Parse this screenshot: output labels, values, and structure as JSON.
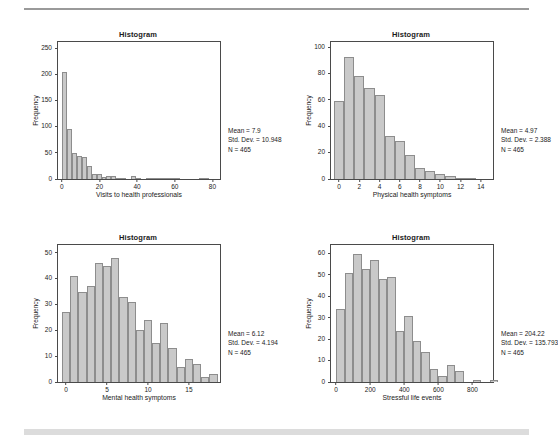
{
  "figure": {
    "panel_count": 4,
    "common_title": "Histogram",
    "common_ylabel": "Frequency",
    "common_n_label": "N = 465"
  },
  "chart_data": [
    {
      "type": "bar",
      "title": "Histogram",
      "xlabel": "Visits to health professionals",
      "ylabel": "Frequency",
      "xlim": [
        -2,
        84
      ],
      "ylim": [
        0,
        262
      ],
      "xticks": [
        0,
        20,
        40,
        60,
        80
      ],
      "yticks": [
        0,
        50,
        100,
        150,
        200,
        250
      ],
      "grid": false,
      "legend": "none",
      "bin_width": 2.6,
      "bin_starts": [
        0.3,
        2.9,
        5.5,
        8.1,
        10.7,
        13.3,
        15.9,
        18.5,
        21.1,
        23.7,
        26.3,
        28.9,
        31.5,
        34.1,
        36.7,
        39.3,
        41.9,
        44.5,
        47.1,
        49.7,
        52.3,
        54.9,
        57.5,
        60.1,
        62.7,
        65.3,
        67.9,
        70.5,
        73.1,
        75.7,
        78.3
      ],
      "values": [
        205,
        95,
        49,
        44,
        43,
        24,
        10,
        10,
        3,
        5,
        5,
        1,
        1,
        0,
        5,
        1,
        0,
        1,
        1,
        1,
        1,
        1,
        2,
        2,
        0,
        0,
        0,
        0,
        1,
        1,
        0
      ],
      "annotations": {
        "mean": "Mean = 7.9",
        "std_dev": "Std. Dev. = 10.948",
        "n": "N = 465"
      }
    },
    {
      "type": "bar",
      "title": "Histogram",
      "xlabel": "Physical health symptoms",
      "ylabel": "Frequency",
      "xlim": [
        -0.8,
        15.2
      ],
      "ylim": [
        0,
        104
      ],
      "xticks": [
        0,
        2,
        4,
        6,
        8,
        10,
        12,
        14
      ],
      "yticks": [
        0,
        20,
        40,
        60,
        80,
        100
      ],
      "grid": false,
      "legend": "none",
      "bin_width": 1,
      "bin_starts": [
        -0.5,
        0.5,
        1.5,
        2.5,
        3.5,
        4.5,
        5.5,
        6.5,
        7.5,
        8.5,
        9.5,
        10.5,
        11.5,
        12.5,
        13.5,
        14.5
      ],
      "values": [
        59,
        93,
        78,
        69,
        64,
        33,
        29,
        18,
        8,
        6,
        4,
        2,
        1,
        1,
        0,
        0
      ],
      "annotations": {
        "mean": "Mean = 4.97",
        "std_dev": "Std. Dev. = 2.388",
        "n": "N = 465"
      }
    },
    {
      "type": "bar",
      "title": "Histogram",
      "xlabel": "Mental health symptoms",
      "ylabel": "Frequency",
      "xlim": [
        -1.0,
        18.8
      ],
      "ylim": [
        0,
        53
      ],
      "xticks": [
        0,
        5,
        10,
        15
      ],
      "yticks": [
        0,
        10,
        20,
        30,
        40,
        50
      ],
      "grid": false,
      "legend": "none",
      "bin_width": 1,
      "bin_starts": [
        -0.5,
        0.5,
        1.5,
        2.5,
        3.5,
        4.5,
        5.5,
        6.5,
        7.5,
        8.5,
        9.5,
        10.5,
        11.5,
        12.5,
        13.5,
        14.5,
        15.5,
        16.5,
        17.5
      ],
      "values": [
        27,
        41,
        35,
        37,
        46,
        45,
        48,
        33,
        31,
        20,
        24,
        15,
        23,
        13,
        6,
        9,
        7,
        2,
        3
      ],
      "annotations": {
        "mean": "Mean = 6.12",
        "std_dev": "Std. Dev. = 4.194",
        "n": "N = 465"
      }
    },
    {
      "type": "bar",
      "title": "Histogram",
      "xlabel": "Stressful life events",
      "ylabel": "Frequency",
      "xlim": [
        -30,
        920
      ],
      "ylim": [
        0,
        64
      ],
      "xticks": [
        0,
        200,
        400,
        600,
        800
      ],
      "yticks": [
        0,
        10,
        20,
        30,
        40,
        50,
        60
      ],
      "grid": false,
      "legend": "none",
      "bin_width": 50,
      "bin_starts": [
        0,
        50,
        100,
        150,
        200,
        250,
        300,
        350,
        400,
        450,
        500,
        550,
        600,
        650,
        700,
        750,
        800,
        850,
        900
      ],
      "values": [
        34,
        51,
        60,
        53,
        57,
        48,
        49,
        24,
        31,
        19,
        14,
        6,
        3,
        8,
        5,
        0,
        1,
        0,
        1
      ],
      "annotations": {
        "mean": "Mean = 204.22",
        "std_dev": "Std. Dev. = 135.793",
        "n": "N = 465"
      }
    }
  ]
}
